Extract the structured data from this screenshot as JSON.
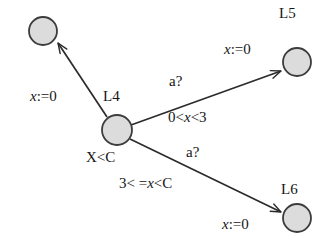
{
  "figure": {
    "kind": "timed-automaton-fragment",
    "background_color": "#ffffff",
    "node_fill": "#dcdcdc",
    "node_stroke": "#3c3c3c",
    "edge_color": "#2b2b2b"
  },
  "nodes": [
    {
      "id": "top_left",
      "label": "",
      "cx": 43,
      "cy": 31,
      "r": 14
    },
    {
      "id": "L4",
      "label": "L4",
      "cx": 117,
      "cy": 130,
      "r": 15,
      "label_x": 103,
      "label_y": 89,
      "invariant": "X<C",
      "invariant_x": 86,
      "invariant_y": 150
    },
    {
      "id": "L5",
      "label": "L5",
      "cx": 297,
      "cy": 62,
      "r": 14,
      "label_x": 279,
      "label_y": 6
    },
    {
      "id": "L6",
      "label": "L6",
      "cx": 297,
      "cy": 218,
      "r": 14,
      "label_x": 281,
      "label_y": 182
    }
  ],
  "edges": [
    {
      "id": "L4-to-topleft",
      "from": "L4",
      "to": "top_left",
      "assignment_prefix": "x",
      "assignment_rest": ":=0",
      "assignment_x": 30,
      "assignment_y": 89,
      "guard": "",
      "event": ""
    },
    {
      "id": "L4-to-L5",
      "from": "L4",
      "to": "L5",
      "event": "a?",
      "event_x": 169,
      "event_y": 74,
      "guard_prefix": "0<",
      "guard_var": "x",
      "guard_suffix": "<3",
      "guard_x": 168,
      "guard_y": 110,
      "assignment_prefix": "x",
      "assignment_rest": ":=0",
      "assignment_x": 224,
      "assignment_y": 42
    },
    {
      "id": "L4-to-L6",
      "from": "L4",
      "to": "L6",
      "event": "a?",
      "event_x": 186,
      "event_y": 145,
      "guard_prefix": "3< =",
      "guard_var": "x",
      "guard_suffix": "<C",
      "guard_x": 119,
      "guard_y": 176,
      "assignment_prefix": "x",
      "assignment_rest": ":=0",
      "assignment_x": 222,
      "assignment_y": 217
    }
  ]
}
